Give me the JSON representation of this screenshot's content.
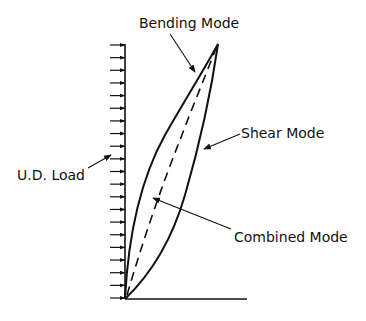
{
  "diagram": {
    "type": "deformation-modes",
    "labels": {
      "bending": "Bending Mode",
      "shear": "Shear Mode",
      "combined": "Combined Mode",
      "load": "U.D. Load"
    },
    "colors": {
      "ink": "#111111",
      "background": "#ffffff"
    },
    "load": {
      "arrow_count": 21,
      "direction": "right",
      "x_tail": 110,
      "x_head": 125,
      "y_top": 45,
      "y_bottom": 298
    },
    "structure": {
      "base": [
        125,
        299
      ],
      "apex": [
        218,
        44
      ],
      "ground_end_x": 247
    },
    "curves": {
      "bending_mode": "solid, convex toward upper-left",
      "shear_mode": "solid, convex toward lower-right",
      "combined_mode": "dashed, near straight"
    }
  }
}
